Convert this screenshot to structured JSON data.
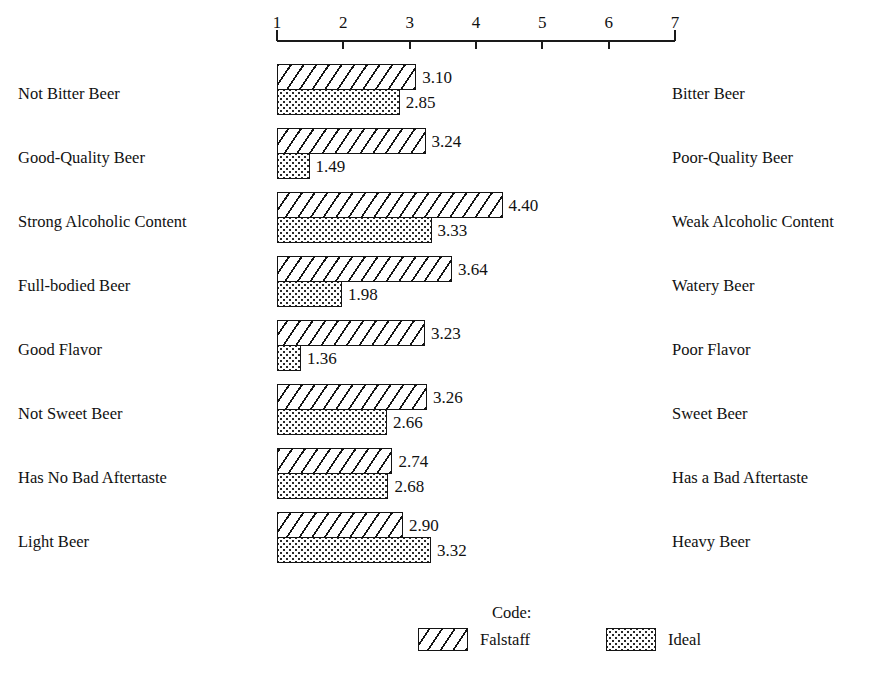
{
  "chart_data": {
    "type": "bar",
    "orientation": "horizontal",
    "title": "",
    "subtitle": "",
    "xlabel": "",
    "ylabel": "",
    "xlim": [
      1,
      7
    ],
    "grid": false,
    "legend_position": "bottom",
    "axis": {
      "ticks": [
        "1",
        "2",
        "3",
        "4",
        "5",
        "6",
        "7"
      ],
      "tick_values": [
        1,
        2,
        3,
        4,
        5,
        6,
        7
      ],
      "min": 1,
      "max": 7
    },
    "categories": [
      "Not Bitter Beer",
      "Good-Quality Beer",
      "Strong Alcoholic Content",
      "Full-bodied Beer",
      "Good Flavor",
      "Not Sweet Beer",
      "Has No Bad Aftertaste",
      "Light Beer"
    ],
    "categories_right": [
      "Bitter Beer",
      "Poor-Quality Beer",
      "Weak Alcoholic Content",
      "Watery Beer",
      "Poor Flavor",
      "Sweet Beer",
      "Has a Bad Aftertaste",
      "Heavy Beer"
    ],
    "series": [
      {
        "name": "Falstaff",
        "pattern": "diagonal-hatch",
        "values": [
          3.1,
          3.24,
          4.4,
          3.64,
          3.23,
          3.26,
          2.74,
          2.9
        ],
        "labels": [
          "3.10",
          "3.24",
          "4.40",
          "3.64",
          "3.23",
          "3.26",
          "2.74",
          "2.90"
        ]
      },
      {
        "name": "Ideal",
        "pattern": "dotted-fill",
        "values": [
          2.85,
          1.49,
          3.33,
          1.98,
          1.36,
          2.66,
          2.68,
          3.32
        ],
        "labels": [
          "2.85",
          "1.49",
          "3.33",
          "1.98",
          "1.36",
          "2.66",
          "2.68",
          "3.32"
        ]
      }
    ],
    "rows": [
      {
        "left": "Not Bitter Beer",
        "right": "Bitter Beer",
        "falstaff": 3.1,
        "falstaff_label": "3.10",
        "ideal": 2.85,
        "ideal_label": "2.85"
      },
      {
        "left": "Good-Quality Beer",
        "right": "Poor-Quality Beer",
        "falstaff": 3.24,
        "falstaff_label": "3.24",
        "ideal": 1.49,
        "ideal_label": "1.49"
      },
      {
        "left": "Strong Alcoholic Content",
        "right": "Weak Alcoholic Content",
        "falstaff": 4.4,
        "falstaff_label": "4.40",
        "ideal": 3.33,
        "ideal_label": "3.33"
      },
      {
        "left": "Full-bodied Beer",
        "right": "Watery Beer",
        "falstaff": 3.64,
        "falstaff_label": "3.64",
        "ideal": 1.98,
        "ideal_label": "1.98"
      },
      {
        "left": "Good Flavor",
        "right": "Poor Flavor",
        "falstaff": 3.23,
        "falstaff_label": "3.23",
        "ideal": 1.36,
        "ideal_label": "1.36"
      },
      {
        "left": "Not Sweet Beer",
        "right": "Sweet Beer",
        "falstaff": 3.26,
        "falstaff_label": "3.26",
        "ideal": 2.66,
        "ideal_label": "2.66"
      },
      {
        "left": "Has No Bad Aftertaste",
        "right": "Has a Bad Aftertaste",
        "falstaff": 2.74,
        "falstaff_label": "2.74",
        "ideal": 2.68,
        "ideal_label": "2.68"
      },
      {
        "left": "Light Beer",
        "right": "Heavy Beer",
        "falstaff": 2.9,
        "falstaff_label": "2.90",
        "ideal": 3.32,
        "ideal_label": "3.32"
      }
    ],
    "legend": {
      "title": "Code:",
      "entries": [
        {
          "label": "Falstaff",
          "pattern": "diagonal-hatch"
        },
        {
          "label": "Ideal",
          "pattern": "dotted-fill"
        }
      ]
    },
    "colors": {
      "ink": "#141414",
      "background": "#ffffff"
    }
  }
}
